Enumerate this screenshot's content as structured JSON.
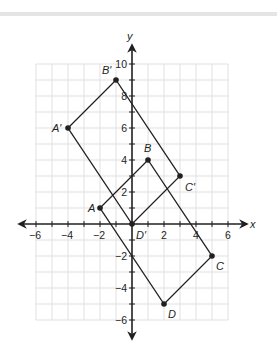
{
  "diagram": {
    "type": "coordinate-plane-transformation",
    "axes": {
      "x_label": "x",
      "y_label": "y",
      "x_range": [
        -6,
        6
      ],
      "y_range": [
        -6,
        10
      ],
      "x_ticks": [
        -6,
        -4,
        -2,
        2,
        4,
        6
      ],
      "y_ticks": [
        10,
        8,
        6,
        4,
        2,
        -2,
        -4,
        -6
      ],
      "x_tick_labels": [
        "−6",
        "−4",
        "−2",
        "2",
        "4",
        "6"
      ],
      "y_tick_labels": [
        "10",
        "8",
        "6",
        "4",
        "2",
        "−2",
        "−4",
        "−6"
      ]
    },
    "original": {
      "name": "ABCD",
      "vertices": [
        {
          "label": "A",
          "x": -2,
          "y": 1
        },
        {
          "label": "B",
          "x": 1,
          "y": 4
        },
        {
          "label": "C",
          "x": 5,
          "y": -2
        },
        {
          "label": "D",
          "x": 2,
          "y": -5
        }
      ]
    },
    "image": {
      "name": "A′B′C′D′",
      "vertices": [
        {
          "label": "A′",
          "x": -4,
          "y": 6
        },
        {
          "label": "B′",
          "x": -1,
          "y": 9
        },
        {
          "label": "C′",
          "x": 3,
          "y": 3
        },
        {
          "label": "D′",
          "x": 0,
          "y": 0
        }
      ]
    },
    "colors": {
      "grid": "#d9d9d9",
      "axis": "#231f20",
      "shape": "#231f20",
      "topbar": "#e4e4e4"
    }
  }
}
